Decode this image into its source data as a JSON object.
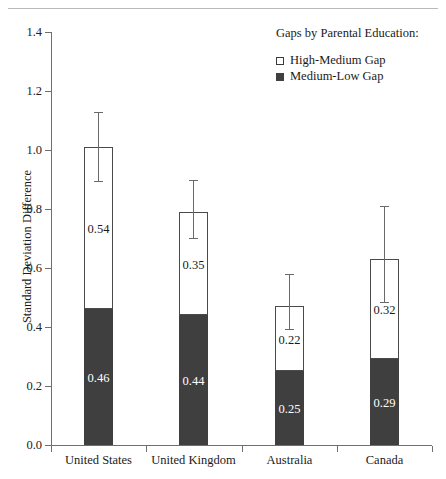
{
  "figure": {
    "clipped_title_remnant": "",
    "y_axis_title": "Standard Deviation Difference"
  },
  "legend": {
    "title": "Gaps by Parental Education:",
    "items": [
      {
        "label": "High-Medium Gap",
        "marker": "open-square",
        "color": "#ffffff"
      },
      {
        "label": "Medium-Low Gap",
        "marker": "filled-square",
        "color": "#3f3f3f"
      }
    ]
  },
  "chart_data": {
    "type": "bar",
    "subtype": "stacked-bar-with-error-bars",
    "title": "",
    "xlabel": "",
    "ylabel": "Standard Deviation Difference",
    "ylim": [
      0.0,
      1.4
    ],
    "ytick_labels": [
      "0.0",
      "0.2",
      "0.4",
      "0.6",
      "0.8",
      "1.0",
      "1.2",
      "1.4"
    ],
    "ytick_values": [
      0.0,
      0.2,
      0.4,
      0.6,
      0.8,
      1.0,
      1.2,
      1.4
    ],
    "grid": false,
    "legend_position": "top-right",
    "categories": [
      "United States",
      "United Kingdom",
      "Australia",
      "Canada"
    ],
    "series": [
      {
        "name": "Medium-Low Gap",
        "values": [
          0.46,
          0.44,
          0.25,
          0.29
        ],
        "color": "#3f3f3f"
      },
      {
        "name": "High-Medium Gap",
        "values": [
          0.54,
          0.35,
          0.22,
          0.32
        ],
        "color": "#ffffff"
      }
    ],
    "totals": [
      1.01,
      0.79,
      0.47,
      0.63
    ],
    "error_bars": [
      {
        "category": "United States",
        "upper": 1.13,
        "lower": 0.89
      },
      {
        "category": "United Kingdom",
        "upper": 0.9,
        "lower": 0.7
      },
      {
        "category": "Australia",
        "upper": 0.58,
        "lower": 0.39
      },
      {
        "category": "Canada",
        "upper": 0.81,
        "lower": 0.48
      }
    ],
    "data_labels": [
      {
        "category": "United States",
        "high_medium": "0.54",
        "medium_low": "0.46"
      },
      {
        "category": "United Kingdom",
        "high_medium": "0.35",
        "medium_low": "0.44"
      },
      {
        "category": "Australia",
        "high_medium": "0.22",
        "medium_low": "0.25"
      },
      {
        "category": "Canada",
        "high_medium": "0.32",
        "medium_low": "0.29"
      }
    ]
  }
}
